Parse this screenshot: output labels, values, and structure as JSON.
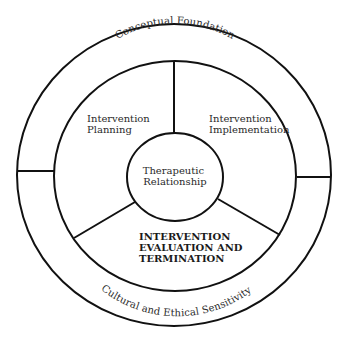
{
  "diagram": {
    "outer_ring": {
      "top_label": "Conceptual Foundation",
      "bottom_label": "Cultural and Ethical Sensitivity"
    },
    "segments": [
      {
        "id": "planning",
        "lines": [
          "Intervention",
          "Planning"
        ]
      },
      {
        "id": "implementation",
        "lines": [
          "Intervention",
          "Implementation"
        ]
      },
      {
        "id": "evaluation",
        "lines": [
          "INTERVENTION",
          "EVALUATION AND",
          "TERMINATION"
        ],
        "emphasis": "bold"
      }
    ],
    "center": {
      "lines": [
        "Therapeutic",
        "Relationship"
      ]
    },
    "colors": {
      "stroke": "#111111",
      "text": "#2a2a2a",
      "background": "#ffffff"
    }
  }
}
